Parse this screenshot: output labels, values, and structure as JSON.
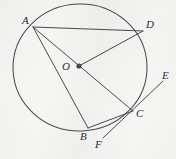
{
  "figure": {
    "type": "geometry-diagram",
    "canvas": {
      "width": 176,
      "height": 159
    },
    "background_color": "#f6f6f5",
    "stroke_color": "#4a4a4a",
    "label_color": "#2b2b2b"
  },
  "circle": {
    "name": "main-circle",
    "center_label": "O",
    "cx": 80,
    "cy": 67.5,
    "rx": 67,
    "ry": 63.5,
    "rotation_deg": -2
  },
  "points": [
    {
      "id": "A",
      "label": "A",
      "x": 33,
      "y": 27,
      "label_x": 22,
      "label_y": 15,
      "on_circle": true
    },
    {
      "id": "D",
      "label": "D",
      "x": 143,
      "y": 31,
      "label_x": 146,
      "label_y": 19,
      "on_circle": true
    },
    {
      "id": "O",
      "label": "O",
      "x": 79,
      "y": 66,
      "label_x": 62,
      "label_y": 61,
      "on_circle": false
    },
    {
      "id": "C",
      "label": "C",
      "x": 133,
      "y": 111,
      "label_x": 136,
      "label_y": 108,
      "on_circle": true
    },
    {
      "id": "B",
      "label": "B",
      "x": 88,
      "y": 128,
      "label_x": 80,
      "label_y": 131,
      "on_circle": true
    },
    {
      "id": "E",
      "label": "E",
      "x": 163,
      "y": 81,
      "label_x": 162,
      "label_y": 70,
      "on_circle": false
    },
    {
      "id": "F",
      "label": "F",
      "x": 103,
      "y": 138,
      "label_x": 95,
      "label_y": 139,
      "on_circle": false
    }
  ],
  "center_dot": {
    "name": "center-point-O",
    "x": 79,
    "y": 66,
    "radius": 2.6
  },
  "segments": [
    {
      "id": "AD",
      "name": "chord-A-D",
      "from": "A",
      "to": "D"
    },
    {
      "id": "AC",
      "name": "diameter-A-C",
      "from": "A",
      "to": "C"
    },
    {
      "id": "AB",
      "name": "chord-A-B",
      "from": "A",
      "to": "B"
    },
    {
      "id": "DO",
      "name": "radius-D-O",
      "from": "D",
      "to": "O"
    },
    {
      "id": "BC",
      "name": "chord-B-C",
      "from": "B",
      "to": "C"
    },
    {
      "id": "EF",
      "name": "tangent-line-E-F",
      "from": "E",
      "to": "F"
    }
  ],
  "labels": {
    "A": "A",
    "B": "B",
    "C": "C",
    "D": "D",
    "E": "E",
    "F": "F",
    "O": "O"
  }
}
